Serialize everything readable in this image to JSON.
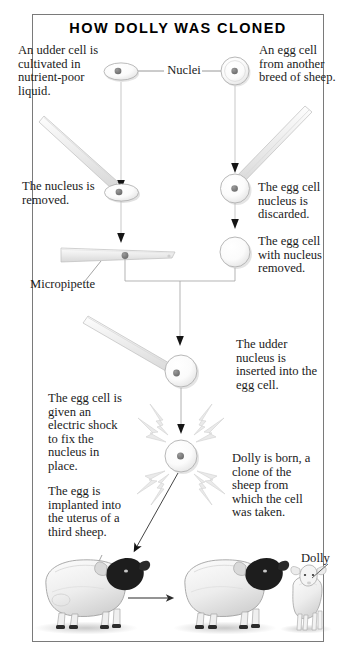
{
  "poster": {
    "title": "HOW DOLLY WAS CLONED",
    "border_color": "#7a7a7a",
    "background": "#ffffff",
    "ink_color": "#1b1b1b"
  },
  "labels": {
    "nuclei": "Nuclei",
    "micropipette": "Micropipette",
    "dolly": "Dolly"
  },
  "captions": {
    "udder_cell": "An udder cell is cultivated in nutrient-poor liquid.",
    "egg_cell_source": "An egg cell from another breed of sheep.",
    "nucleus_removed": "The nucleus is removed.",
    "egg_nucleus_discarded": "The egg cell nucleus is discarded.",
    "egg_cell_enucleated": "The egg cell with nucleus removed.",
    "nucleus_inserted": "The udder nucleus is inserted into the egg cell.",
    "electric_shock": "The egg cell is given an electric shock to fix the nucleus in place.",
    "implanted": "The egg is implanted into the uterus of a third sheep.",
    "dolly_born": "Dolly is born, a clone of the sheep from which the cell was taken."
  },
  "diagram": {
    "type": "process-flow",
    "steps": [
      {
        "id": 1,
        "side": "left",
        "text": "An udder cell is cultivated in nutrient-poor liquid."
      },
      {
        "id": 2,
        "side": "right",
        "text": "An egg cell from another breed of sheep."
      },
      {
        "id": 3,
        "side": "left",
        "text": "The nucleus is removed."
      },
      {
        "id": 4,
        "side": "right",
        "text": "The egg cell nucleus is discarded."
      },
      {
        "id": 5,
        "side": "right",
        "text": "The egg cell with nucleus removed."
      },
      {
        "id": 6,
        "side": "right",
        "text": "The udder nucleus is inserted into the egg cell."
      },
      {
        "id": 7,
        "side": "left",
        "text": "The egg cell is given an electric shock to fix the nucleus in place."
      },
      {
        "id": 8,
        "side": "left",
        "text": "The egg is implanted into the uterus of a third sheep."
      },
      {
        "id": 9,
        "side": "right",
        "text": "Dolly is born, a clone of the sheep from which the cell was taken."
      }
    ],
    "cells": [
      {
        "name": "udder-cell-top",
        "shape": "oval",
        "has_nucleus": true
      },
      {
        "name": "egg-cell-top",
        "shape": "circle",
        "has_nucleus": true
      },
      {
        "name": "udder-cell-extract",
        "shape": "oval",
        "has_nucleus": true
      },
      {
        "name": "egg-cell-extract",
        "shape": "circle",
        "has_nucleus": true
      },
      {
        "name": "micropipette-cell",
        "shape": "pipette",
        "has_nucleus": true
      },
      {
        "name": "egg-cell-empty",
        "shape": "circle",
        "has_nucleus": false
      },
      {
        "name": "fused-cell",
        "shape": "circle",
        "has_nucleus": true
      },
      {
        "name": "shocked-cell",
        "shape": "circle",
        "has_nucleus": true
      }
    ],
    "animals": [
      {
        "name": "surrogate-ewe",
        "type": "sheep"
      },
      {
        "name": "cloned-ewe",
        "type": "sheep"
      },
      {
        "name": "dolly-lamb",
        "type": "lamb",
        "label": "Dolly"
      }
    ]
  }
}
